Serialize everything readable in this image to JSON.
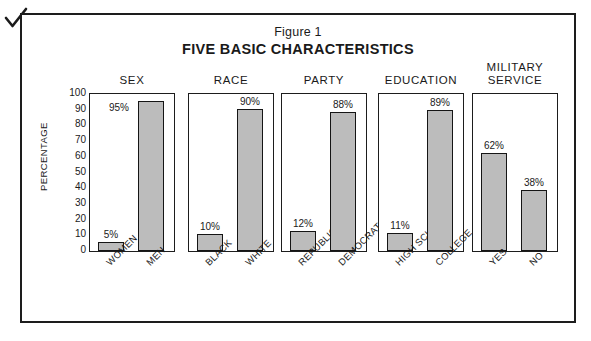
{
  "annotation": {
    "check_mark": "check-mark"
  },
  "header": {
    "figure_label": "Figure 1",
    "title": "FIVE BASIC CHARACTERISTICS"
  },
  "axis": {
    "ylabel": "PERCENTAGE",
    "yticks": [
      "100",
      "90",
      "80",
      "70",
      "60",
      "50",
      "40",
      "30",
      "20",
      "10",
      "0"
    ]
  },
  "panels": [
    {
      "title": "SEX",
      "categories": [
        "WOMEN",
        "MEN"
      ],
      "values": [
        5,
        95
      ],
      "labels": [
        "5%",
        "95%"
      ]
    },
    {
      "title": "RACE",
      "categories": [
        "BLACK",
        "WHITE"
      ],
      "values": [
        10,
        90
      ],
      "labels": [
        "10%",
        "90%"
      ]
    },
    {
      "title": "PARTY",
      "categories": [
        "REPUBLICAN",
        "DEMOCRAT"
      ],
      "values": [
        12,
        88
      ],
      "labels": [
        "12%",
        "88%"
      ]
    },
    {
      "title": "EDUCATION",
      "categories": [
        "HIGH SCHOOL",
        "COLLEGE"
      ],
      "values": [
        11,
        89
      ],
      "labels": [
        "11%",
        "89%"
      ]
    },
    {
      "title": "MILITARY\nSERVICE",
      "categories": [
        "YES",
        "NO"
      ],
      "values": [
        62,
        38
      ],
      "labels": [
        "62%",
        "38%"
      ]
    }
  ],
  "colors": {
    "bar_fill": "#bcbcbc",
    "bar_stroke": "#151515",
    "frame": "#1d1d1d",
    "background": "#ffffff"
  },
  "chart_data": {
    "type": "bar",
    "title": "FIVE BASIC CHARACTERISTICS",
    "subtitle": "Figure 1",
    "xlabel": "",
    "ylabel": "PERCENTAGE",
    "ylim": [
      0,
      100
    ],
    "ytick_step": 10,
    "grid": false,
    "legend": "none",
    "panels": [
      {
        "name": "SEX",
        "categories": [
          "WOMEN",
          "MEN"
        ],
        "values": [
          5,
          95
        ]
      },
      {
        "name": "RACE",
        "categories": [
          "BLACK",
          "WHITE"
        ],
        "values": [
          10,
          90
        ]
      },
      {
        "name": "PARTY",
        "categories": [
          "REPUBLICAN",
          "DEMOCRAT"
        ],
        "values": [
          12,
          88
        ]
      },
      {
        "name": "EDUCATION",
        "categories": [
          "HIGH SCHOOL",
          "COLLEGE"
        ],
        "values": [
          11,
          89
        ]
      },
      {
        "name": "MILITARY SERVICE",
        "categories": [
          "YES",
          "NO"
        ],
        "values": [
          62,
          38
        ]
      }
    ],
    "categories": [
      "WOMEN",
      "MEN",
      "BLACK",
      "WHITE",
      "REPUBLICAN",
      "DEMOCRAT",
      "HIGH SCHOOL",
      "COLLEGE",
      "YES",
      "NO"
    ],
    "values": [
      5,
      95,
      10,
      90,
      12,
      88,
      11,
      89,
      62,
      38
    ]
  }
}
